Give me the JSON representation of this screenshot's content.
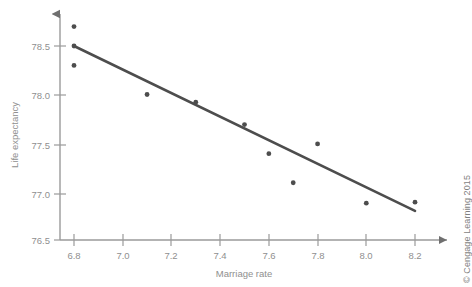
{
  "chart_data": {
    "type": "scatter",
    "title": "",
    "xlabel": "Marriage rate",
    "ylabel": "Life expectancy",
    "xlim": [
      6.7,
      8.3
    ],
    "ylim": [
      76.45,
      78.8
    ],
    "xticks": [
      "6.8",
      "7.0",
      "7.2",
      "7.4",
      "7.6",
      "7.8",
      "8.0",
      "8.2"
    ],
    "xtick_values": [
      6.8,
      7.0,
      7.2,
      7.4,
      7.6,
      7.8,
      8.0,
      8.2
    ],
    "yticks": [
      "76.5",
      "77.0",
      "77.5",
      "78.0",
      "78.5"
    ],
    "ytick_values": [
      76.5,
      77.0,
      77.5,
      78.0,
      78.5
    ],
    "grid": false,
    "legend": false,
    "point_color": "#4d4d4d",
    "line_color": "#4d4d4d",
    "axis_color": "#9a9a9a",
    "points": [
      {
        "x": 6.8,
        "y": 78.7
      },
      {
        "x": 6.8,
        "y": 78.5
      },
      {
        "x": 6.8,
        "y": 78.3
      },
      {
        "x": 7.1,
        "y": 78.0
      },
      {
        "x": 7.3,
        "y": 77.92
      },
      {
        "x": 7.5,
        "y": 77.69
      },
      {
        "x": 7.6,
        "y": 77.39
      },
      {
        "x": 7.7,
        "y": 77.09
      },
      {
        "x": 7.8,
        "y": 77.49
      },
      {
        "x": 8.0,
        "y": 76.88
      },
      {
        "x": 8.2,
        "y": 76.89
      }
    ],
    "trendline": {
      "x0": 6.8,
      "y0": 78.5,
      "x1": 8.2,
      "y1": 76.8
    }
  },
  "credit": {
    "text": "© Cengage Learning 2015"
  }
}
